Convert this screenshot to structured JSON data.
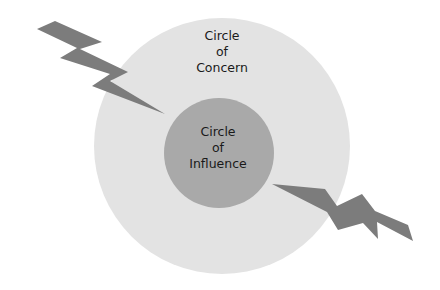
{
  "diagram": {
    "type": "concentric-circles",
    "colors": {
      "outer_circle": "#e3e3e3",
      "inner_circle": "#a9a9a9",
      "bolt": "#7c7c7c",
      "text": "#1a1a1a",
      "background": "#ffffff"
    },
    "outer_circle": {
      "label_lines": [
        "Circle",
        "of",
        "Concern"
      ]
    },
    "inner_circle": {
      "label_lines": [
        "Circle",
        "of",
        "Influence"
      ]
    },
    "bolts": [
      {
        "name": "upper-left-lightning-bolt",
        "direction": "into-inner-circle"
      },
      {
        "name": "lower-right-lightning-bolt",
        "direction": "out-of-inner-circle"
      }
    ]
  }
}
